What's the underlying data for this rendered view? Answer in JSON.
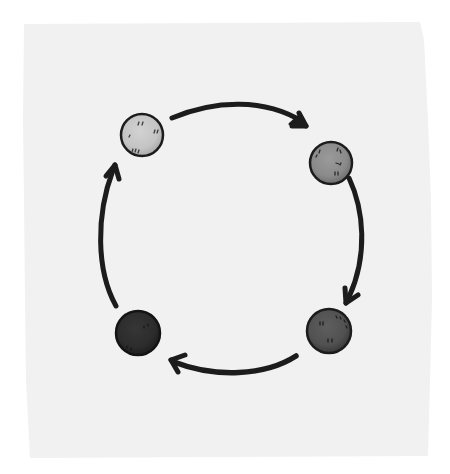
{
  "diagram": {
    "type": "cycle",
    "direction": "clockwise",
    "background_color": "#ffffff",
    "paper_color": "#f1f1f1",
    "stroke_color": "#1c1c1c",
    "nodes": [
      {
        "id": "node-top-left",
        "shade": "light",
        "fill": "#c9c9c9",
        "cx": 142,
        "cy": 135,
        "r": 21
      },
      {
        "id": "node-top-right",
        "shade": "medium",
        "fill": "#8f8f8f",
        "cx": 331,
        "cy": 163,
        "r": 21
      },
      {
        "id": "node-bottom-right",
        "shade": "dark",
        "fill": "#555555",
        "cx": 329,
        "cy": 331,
        "r": 22
      },
      {
        "id": "node-bottom-left",
        "shade": "darkest",
        "fill": "#2e2e2e",
        "cx": 138,
        "cy": 333,
        "r": 22
      }
    ],
    "edges": [
      {
        "from": "node-top-left",
        "to": "node-top-right"
      },
      {
        "from": "node-top-right",
        "to": "node-bottom-right"
      },
      {
        "from": "node-bottom-right",
        "to": "node-bottom-left"
      },
      {
        "from": "node-bottom-left",
        "to": "node-top-left"
      }
    ]
  }
}
